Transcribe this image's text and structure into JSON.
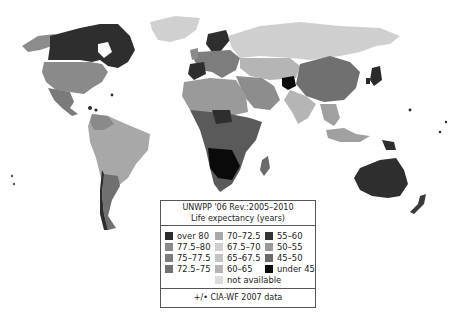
{
  "legend": {
    "title_line1": "UNWPP '06 Rev.:2005–2010",
    "title_line2": "Life expectancy (years)",
    "columns": [
      [
        {
          "label": "over 80",
          "color": "#2b2b2b"
        },
        {
          "label": "77.5–80",
          "color": "#8a8a8a"
        },
        {
          "label": "75–77.5",
          "color": "#7d7d7d"
        },
        {
          "label": "72.5–75",
          "color": "#737373"
        }
      ],
      [
        {
          "label": "70–72.5",
          "color": "#a9a9a9"
        },
        {
          "label": "67.5–70",
          "color": "#d0d0d0"
        },
        {
          "label": "65–67.5",
          "color": "#c4c4c4"
        },
        {
          "label": "60–65",
          "color": "#b4b4b4"
        },
        {
          "label": "not available",
          "color": "#dcdcdc"
        }
      ],
      [
        {
          "label": "55–60",
          "color": "#333333"
        },
        {
          "label": "50–55",
          "color": "#9a9a9a"
        },
        {
          "label": "45–50",
          "color": "#6a6a6a"
        },
        {
          "label": "under 45",
          "color": "#0a0a0a"
        }
      ]
    ],
    "footer": "+/• CIA-WF 2007 data"
  },
  "map_regions": [
    {
      "name": "Alaska",
      "shade": "#8c8c8c"
    },
    {
      "name": "Canada",
      "shade": "#2e2e2e"
    },
    {
      "name": "Greenland",
      "shade": "#d0d0d0"
    },
    {
      "name": "United States",
      "shade": "#8a8a8a"
    },
    {
      "name": "Mexico",
      "shade": "#7a7a7a"
    },
    {
      "name": "South America",
      "shade": "#a8a8a8"
    },
    {
      "name": "Argentina/Chile",
      "shade": "#707070"
    },
    {
      "name": "Europe",
      "shade": "#7d7d7d"
    },
    {
      "name": "Russia",
      "shade": "#cfcfcf"
    },
    {
      "name": "North Africa",
      "shade": "#9a9a9a"
    },
    {
      "name": "Central/Southern Africa",
      "shade": "#3a3a3a"
    },
    {
      "name": "Middle East",
      "shade": "#8d8d8d"
    },
    {
      "name": "China",
      "shade": "#707070"
    },
    {
      "name": "India",
      "shade": "#b5b5b5"
    },
    {
      "name": "Southeast Asia",
      "shade": "#a0a0a0"
    },
    {
      "name": "Japan",
      "shade": "#2a2a2a"
    },
    {
      "name": "Australia",
      "shade": "#2e2e2e"
    },
    {
      "name": "New Zealand",
      "shade": "#3a3a3a"
    }
  ]
}
